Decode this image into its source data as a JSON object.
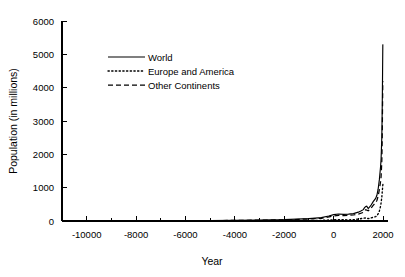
{
  "chart_data": {
    "type": "line",
    "title": "",
    "xlabel": "Year",
    "ylabel": "Population (in millions)",
    "xlim": [
      -11000,
      2200
    ],
    "ylim": [
      0,
      6000
    ],
    "xticks": [
      -10000,
      -8000,
      -6000,
      -4000,
      -2000,
      0,
      2000
    ],
    "xtick_labels": [
      "-10000",
      "-8000",
      "-6000",
      "-4000",
      "-2000",
      "0",
      "2000"
    ],
    "yticks": [
      0,
      1000,
      2000,
      3000,
      4000,
      5000,
      6000
    ],
    "ytick_labels": [
      "0",
      "1000",
      "2000",
      "3000",
      "4000",
      "5000",
      "6000"
    ],
    "grid": false,
    "legend_position": "upper-left-inside",
    "series": [
      {
        "name": "World",
        "style": "solid",
        "x": [
          -10000,
          -9000,
          -8000,
          -7000,
          -6000,
          -5000,
          -4000,
          -3000,
          -2000,
          -1500,
          -1000,
          -500,
          -200,
          0,
          200,
          400,
          600,
          800,
          1000,
          1100,
          1200,
          1250,
          1300,
          1340,
          1400,
          1500,
          1600,
          1700,
          1750,
          1800,
          1850,
          1900,
          1920,
          1940,
          1950,
          1960,
          1970,
          1980,
          1990,
          1995
        ],
        "y": [
          4,
          5,
          6,
          8,
          10,
          14,
          20,
          27,
          40,
          55,
          72,
          100,
          150,
          190,
          210,
          200,
          206,
          220,
          265,
          300,
          340,
          400,
          432,
          443,
          374,
          458,
          580,
          679,
          770,
          954,
          1241,
          1634,
          1860,
          2300,
          2525,
          3018,
          3682,
          4440,
          5270,
          5300
        ]
      },
      {
        "name": "Europe and America",
        "style": "dotted",
        "x": [
          -10000,
          -8000,
          -6000,
          -4000,
          -2000,
          -1000,
          -500,
          0,
          200,
          400,
          600,
          800,
          1000,
          1200,
          1300,
          1400,
          1500,
          1600,
          1700,
          1750,
          1800,
          1850,
          1900,
          1920,
          1940,
          1950,
          1960,
          1970,
          1980,
          1990,
          1995
        ],
        "y": [
          1,
          1,
          2,
          3,
          6,
          12,
          20,
          36,
          42,
          38,
          34,
          40,
          58,
          82,
          92,
          70,
          90,
          110,
          130,
          155,
          212,
          300,
          450,
          540,
          660,
          720,
          810,
          900,
          990,
          1080,
          1100
        ]
      },
      {
        "name": "Other Continents",
        "style": "dashed",
        "x": [
          -10000,
          -8000,
          -6000,
          -4000,
          -2000,
          -1000,
          -500,
          0,
          200,
          400,
          600,
          800,
          1000,
          1200,
          1300,
          1400,
          1500,
          1600,
          1700,
          1750,
          1800,
          1850,
          1900,
          1920,
          1940,
          1950,
          1960,
          1970,
          1980,
          1990,
          1995
        ],
        "y": [
          3,
          5,
          8,
          17,
          34,
          60,
          80,
          154,
          168,
          162,
          172,
          180,
          207,
          258,
          340,
          304,
          368,
          470,
          549,
          615,
          742,
          941,
          1184,
          1320,
          1640,
          1805,
          2208,
          2782,
          3540,
          4190,
          4200
        ]
      }
    ]
  },
  "legend": {
    "items": [
      {
        "label": "World",
        "style": "solid"
      },
      {
        "label": "Europe and America",
        "style": "dotted"
      },
      {
        "label": "Other Continents",
        "style": "dashed"
      }
    ]
  },
  "axes": {
    "x_title": "Year",
    "y_title": "Population (in millions)"
  }
}
